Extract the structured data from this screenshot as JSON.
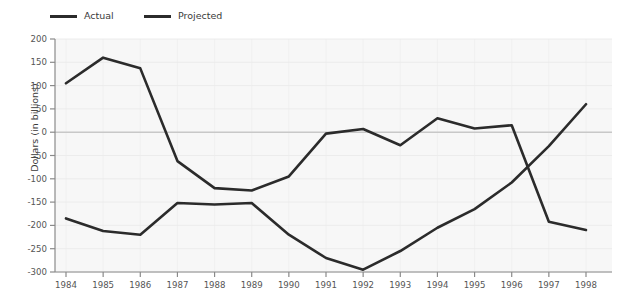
{
  "chart_data": {
    "type": "line",
    "title": "",
    "xlabel": "",
    "ylabel": "Dollars (in billions)",
    "categories": [
      1984,
      1985,
      1986,
      1987,
      1988,
      1989,
      1990,
      1991,
      1992,
      1993,
      1994,
      1995,
      1996,
      1997,
      1998
    ],
    "x_tick_labels": [
      "1984",
      "1985",
      "1986",
      "1987",
      "1988",
      "1989",
      "1990",
      "1991",
      "1992",
      "1993",
      "1994",
      "1995",
      "1996",
      "1997",
      "1998"
    ],
    "y_tick_labels": [
      "200",
      "150",
      "100",
      "50",
      "0",
      "-50",
      "-100",
      "-150",
      "-200",
      "-250",
      "-300"
    ],
    "y_ticks": [
      200,
      150,
      100,
      50,
      0,
      -50,
      -100,
      -150,
      -200,
      -250,
      -300
    ],
    "ylim": [
      -300,
      200
    ],
    "xlim": [
      1984,
      1998
    ],
    "grid": true,
    "legend_position": "top-left",
    "series": [
      {
        "name": "Actual",
        "color": "#2b2b2b",
        "values": [
          -185,
          -212,
          -220,
          -152,
          -155,
          -152,
          -220,
          -270,
          -295,
          -255,
          -205,
          -165,
          -108,
          -30,
          60
        ]
      },
      {
        "name": "Projected",
        "color": "#2b2b2b",
        "values": [
          105,
          160,
          137,
          -62,
          -120,
          -125,
          -95,
          -3,
          7,
          -28,
          30,
          8,
          15,
          -192,
          -210
        ]
      }
    ]
  },
  "legend": {
    "actual_label": "Actual",
    "projected_label": "Projected"
  },
  "axes": {
    "y_title": "Dollars (in billions)"
  },
  "colors": {
    "line": "#2b2b2b",
    "plot_background": "#f7f7f7",
    "gridline": "#ececec",
    "zero_line": "#c8c8c8",
    "axis": "#8a8a8a",
    "tick_text": "#555555"
  }
}
